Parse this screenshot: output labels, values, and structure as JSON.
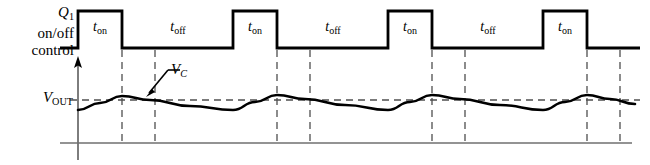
{
  "figure": {
    "colors": {
      "wave": "#000000",
      "axis": "#6b6b6b",
      "dashed": "#5a5a5a",
      "background": "#ffffff"
    }
  },
  "labels": {
    "control_line1_var": "Q",
    "control_line1_sub": "1",
    "control_line2": "on/off",
    "control_line3": "control",
    "vout_var": "V",
    "vout_sub": "OUT",
    "vc_var": "V",
    "vc_sub": "C"
  },
  "timing_labels": {
    "t_var": "t",
    "on_sub": "on",
    "off_sub": "off"
  },
  "chart_data": {
    "type": "line",
    "xlabel": "",
    "ylabel": "",
    "grid": false,
    "legend": "none",
    "series": [
      {
        "name": "Q1 on/off control",
        "type": "square-pulse",
        "high_y": 11,
        "low_y": 48,
        "start_x": 60,
        "end_x": 640,
        "pulses": [
          {
            "rise_x": 78,
            "fall_x": 122,
            "label": "t_on"
          },
          {
            "rise_x": 233,
            "fall_x": 277,
            "label": "t_on"
          },
          {
            "rise_x": 388,
            "fall_x": 432,
            "label": "t_on"
          },
          {
            "rise_x": 543,
            "fall_x": 587,
            "label": "t_on"
          }
        ],
        "gaps": [
          {
            "from_x": 122,
            "to_x": 233,
            "label": "t_off"
          },
          {
            "from_x": 277,
            "to_x": 388,
            "label": "t_off"
          },
          {
            "from_x": 432,
            "to_x": 543,
            "label": "t_off"
          }
        ]
      },
      {
        "name": "VC capacitor voltage",
        "type": "ripple",
        "vout_level_y": 100,
        "axis_origin_x": 78,
        "axis_top_y": 60,
        "baseline_y": 143,
        "points": [
          [
            78,
            110
          ],
          [
            100,
            103
          ],
          [
            122,
            96
          ],
          [
            150,
            100
          ],
          [
            190,
            106
          ],
          [
            233,
            110
          ],
          [
            255,
            102
          ],
          [
            277,
            95
          ],
          [
            305,
            99
          ],
          [
            345,
            105
          ],
          [
            388,
            110
          ],
          [
            410,
            102
          ],
          [
            432,
            95
          ],
          [
            460,
            99
          ],
          [
            500,
            105
          ],
          [
            543,
            110
          ],
          [
            565,
            102
          ],
          [
            587,
            95
          ],
          [
            610,
            99
          ],
          [
            635,
            104
          ]
        ]
      }
    ],
    "dashed_verticals_x": [
      122,
      155,
      277,
      310,
      432,
      465,
      587,
      620
    ],
    "dashed_horizontal_y": 100,
    "annotations": [
      {
        "text": "V_C",
        "x": 171,
        "y": 61,
        "arrow_from": [
          170,
          74
        ],
        "arrow_to": [
          147,
          95
        ]
      }
    ]
  },
  "timing_segments": [
    {
      "label_kind": "on",
      "center_x": 100,
      "y": 31
    },
    {
      "label_kind": "off",
      "center_x": 178,
      "y": 31
    },
    {
      "label_kind": "on",
      "center_x": 255,
      "y": 31
    },
    {
      "label_kind": "off",
      "center_x": 333,
      "y": 31
    },
    {
      "label_kind": "on",
      "center_x": 410,
      "y": 31
    },
    {
      "label_kind": "off",
      "center_x": 488,
      "y": 31
    },
    {
      "label_kind": "on",
      "center_x": 565,
      "y": 31
    }
  ]
}
